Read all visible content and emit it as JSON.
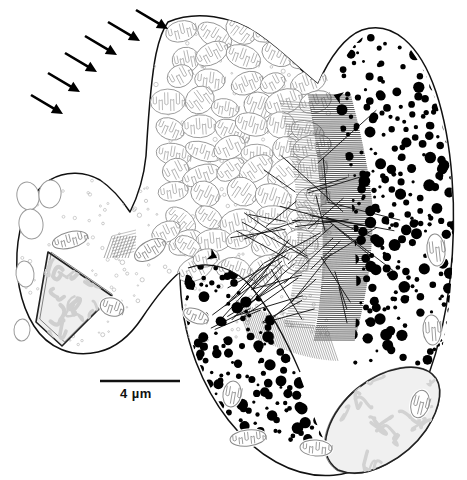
{
  "figure": {
    "kind": "electron-micrograph-line-drawing",
    "background_color": "#ffffff",
    "ink_color": "#111111",
    "gray_outline_color": "#8a8a8a",
    "light_gray_fill": "#e4e4e4",
    "granule_color": "#000000"
  },
  "scalebar": {
    "label": "4 µm",
    "bar_x1": 100,
    "bar_x2": 180,
    "bar_y": 381,
    "label_x": 120,
    "label_y": 386,
    "thickness": 2.4,
    "color": "#111111"
  },
  "surface_arrows": {
    "name": "surface-indicator-arrows",
    "count": 6,
    "color": "#000000",
    "direction": "down-right",
    "items": [
      {
        "x1": 31,
        "y1": 95,
        "x2": 63,
        "y2": 114
      },
      {
        "x1": 48,
        "y1": 73,
        "x2": 80,
        "y2": 92
      },
      {
        "x1": 65,
        "y1": 53,
        "x2": 97,
        "y2": 72
      },
      {
        "x1": 85,
        "y1": 36,
        "x2": 117,
        "y2": 55
      },
      {
        "x1": 108,
        "y1": 22,
        "x2": 140,
        "y2": 41
      },
      {
        "x1": 136,
        "y1": 10,
        "x2": 168,
        "y2": 29
      }
    ]
  },
  "arrowheads": {
    "name": "membrane-arrowheads",
    "count": 2,
    "color": "#000000",
    "items": [
      {
        "x": 209,
        "y": 254,
        "rot": 25
      },
      {
        "x": 342,
        "y": 98,
        "rot": 200
      }
    ]
  },
  "cell_outline": {
    "name": "plasma-membrane",
    "stroke": "#111111",
    "stroke_width": 1.5,
    "path": "M 168,22 C 196,10 232,16 258,34 C 284,52 300,70 318,84 C 330,56 346,36 362,30 C 392,20 420,44 436,92 C 452,140 458,210 450,280 C 442,350 420,412 388,448 C 356,482 312,482 276,462 C 240,442 212,404 196,362 C 184,330 180,300 180,272 C 168,282 154,300 142,318 C 130,336 116,348 98,352 C 72,358 48,348 34,326 C 20,304 14,272 18,242 C 22,212 34,190 50,180 C 66,170 86,172 100,180 C 112,188 122,200 130,212 C 138,196 144,176 146,156 C 148,124 150,84 156,54 C 159,40 162,30 168,22 Z"
  },
  "inner_lobe_outline": {
    "name": "posterior-lobe-membrane",
    "stroke": "#111111",
    "stroke_width": 1.3,
    "path": "M 188,268 C 210,260 236,268 252,288 C 272,312 288,344 300,372"
  },
  "nucleus_left": {
    "name": "nucleus-anterior",
    "shape": "triangular",
    "outline_color": "#222222",
    "fill": "#efefef",
    "chromatin_color": "#cfcfcf",
    "cx": 68,
    "cy": 288,
    "points": "48,252 112,296 62,346 36,322"
  },
  "nucleus_right": {
    "name": "nucleus-posterior",
    "shape": "crescent",
    "outline_color": "#222222",
    "fill": "#f0f0f0",
    "chromatin_color": "#d2d2d2",
    "path": "M 338,470 C 312,452 330,410 358,388 C 386,366 418,362 432,374 C 444,384 442,406 426,430 C 408,456 368,482 338,470 Z"
  },
  "vesicles": {
    "name": "clear-vesicles",
    "outline_color": "#9a9a9a",
    "count": 5,
    "items": [
      {
        "cx": 28,
        "cy": 196,
        "rx": 11,
        "ry": 14,
        "rot": -12
      },
      {
        "cx": 50,
        "cy": 194,
        "rx": 11,
        "ry": 14,
        "rot": 8
      },
      {
        "cx": 31,
        "cy": 224,
        "rx": 12,
        "ry": 15,
        "rot": -8
      },
      {
        "cx": 25,
        "cy": 274,
        "rx": 9,
        "ry": 13,
        "rot": -6
      },
      {
        "cx": 22,
        "cy": 330,
        "rx": 8,
        "ry": 11,
        "rot": 4
      }
    ]
  },
  "mitochondria_mass": {
    "name": "mitochondria-cluster",
    "description": "dense mass of cristate mitochondria",
    "outline_color": "#8f8f8f",
    "crista_color": "#9c9c9c",
    "count": 58,
    "region": {
      "x": 150,
      "y": 25,
      "w": 185,
      "h": 250
    }
  },
  "isolated_mitochondria": {
    "name": "peripheral-mitochondria",
    "outline_color": "#8a8a8a",
    "count": 10,
    "items": [
      {
        "cx": 70,
        "cy": 240,
        "rx": 18,
        "ry": 8,
        "rot": -14
      },
      {
        "cx": 112,
        "cy": 307,
        "rx": 12,
        "ry": 9,
        "rot": 18
      },
      {
        "cx": 150,
        "cy": 250,
        "rx": 17,
        "ry": 9,
        "rot": -30
      },
      {
        "cx": 196,
        "cy": 316,
        "rx": 13,
        "ry": 7,
        "rot": 22
      },
      {
        "cx": 232,
        "cy": 394,
        "rx": 9,
        "ry": 13,
        "rot": 10
      },
      {
        "cx": 248,
        "cy": 438,
        "rx": 18,
        "ry": 8,
        "rot": -6
      },
      {
        "cx": 316,
        "cy": 448,
        "rx": 16,
        "ry": 8,
        "rot": 4
      },
      {
        "cx": 436,
        "cy": 250,
        "rx": 9,
        "ry": 16,
        "rot": -6
      },
      {
        "cx": 432,
        "cy": 330,
        "rx": 9,
        "ry": 15,
        "rot": -4
      },
      {
        "cx": 420,
        "cy": 404,
        "rx": 9,
        "ry": 14,
        "rot": 14
      }
    ]
  },
  "striated_band": {
    "name": "striated-fibre-band",
    "description": "dense band of fine parallel striations",
    "color": "#2a2a2a",
    "light_color": "#777777",
    "line_count": 120,
    "region": {
      "x": 300,
      "y": 95,
      "w": 66,
      "h": 245
    }
  },
  "lower_striations": {
    "name": "lower-striated-patch",
    "color": "#888888",
    "line_count": 40,
    "region": {
      "x": 236,
      "y": 300,
      "w": 90,
      "h": 50
    }
  },
  "microtubules": {
    "name": "microtubule-fibres",
    "color": "#111111",
    "count": 34,
    "region": {
      "x": 205,
      "y": 105,
      "w": 130,
      "h": 200
    }
  },
  "dense_granules": {
    "name": "electron-dense-granules",
    "color": "#000000",
    "approx_count": 520,
    "size_min": 1.4,
    "size_max": 6.0,
    "regions": [
      {
        "note": "right lobe",
        "x": 340,
        "y": 35,
        "w": 120,
        "h": 330
      },
      {
        "note": "posterior lobe",
        "x": 186,
        "y": 262,
        "w": 190,
        "h": 180
      }
    ]
  },
  "cytoplasm_speckles": {
    "name": "cytoplasmic-ribosome-speckles",
    "color": "#b4b4b4",
    "count": 240
  },
  "hatched_patch": {
    "name": "hatched-inclusion",
    "color": "#707070",
    "x": 112,
    "y": 236,
    "w": 24,
    "h": 22
  }
}
